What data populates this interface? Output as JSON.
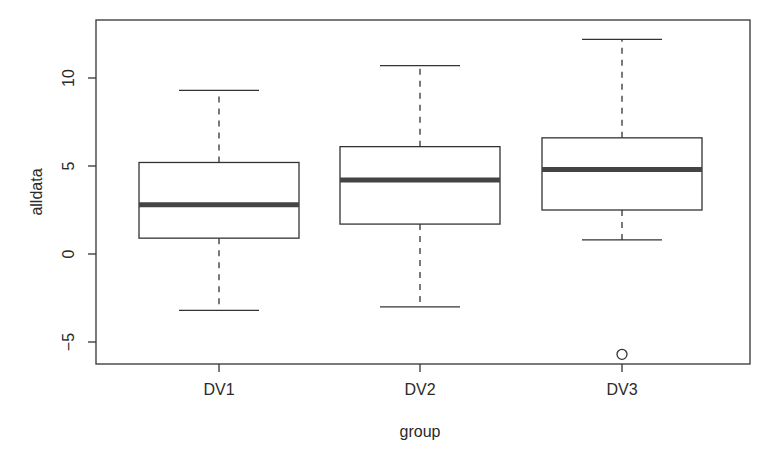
{
  "chart_data": {
    "type": "boxplot",
    "title": "",
    "xlabel": "group",
    "ylabel": "alldata",
    "categories": [
      "DV1",
      "DV2",
      "DV3"
    ],
    "yticks": [
      -5,
      0,
      5,
      10
    ],
    "ylim": [
      -6.2,
      13.2
    ],
    "grid": false,
    "legend": null,
    "boxes": [
      {
        "name": "DV1",
        "whisker_low": -3.2,
        "q1": 0.9,
        "median": 2.8,
        "q3": 5.2,
        "whisker_high": 9.3,
        "outliers": []
      },
      {
        "name": "DV2",
        "whisker_low": -3.0,
        "q1": 1.7,
        "median": 4.2,
        "q3": 6.1,
        "whisker_high": 10.7,
        "outliers": []
      },
      {
        "name": "DV3",
        "whisker_low": 0.8,
        "q1": 2.5,
        "median": 4.8,
        "q3": 6.6,
        "whisker_high": 12.2,
        "outliers": [
          -5.7
        ]
      }
    ]
  },
  "axes": {
    "x_label": "group",
    "y_label": "alldata"
  }
}
